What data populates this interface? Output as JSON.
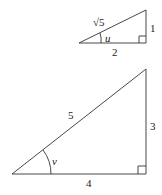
{
  "triangles": [
    {
      "id": "small",
      "hypotenuse_label": "√5",
      "opposite_label": "1",
      "adjacent_label": "2",
      "angle_label": "u",
      "right_angle_marker": true
    },
    {
      "id": "large",
      "hypotenuse_label": "5",
      "opposite_label": "3",
      "adjacent_label": "4",
      "angle_label": "v",
      "right_angle_marker": true
    }
  ],
  "colors": {
    "stroke": "#333333",
    "text": "#222222",
    "background": "#ffffff"
  }
}
